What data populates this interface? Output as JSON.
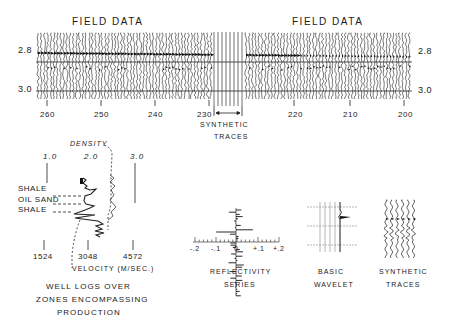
{
  "seismic_section": {
    "left_title": "FIELD DATA",
    "right_title": "FIELD DATA",
    "time_labels_left": [
      "2.8",
      "3.0"
    ],
    "time_labels_right": [
      "2.8",
      "3.0"
    ],
    "trace_numbers": [
      "260",
      "250",
      "240",
      "230",
      "220",
      "210",
      "200"
    ],
    "synthetic_traces_label_line1": "SYNTHETIC",
    "synthetic_traces_label_line2": "TRACES"
  },
  "well_logs": {
    "density_label": "DENSITY",
    "density_ticks": [
      "1.0",
      "2.0",
      "3.0"
    ],
    "zone_labels": [
      "SHALE",
      "OIL SAND",
      "SHALE"
    ],
    "velocity_ticks": [
      "1524",
      "3048",
      "4572"
    ],
    "velocity_label": "VELOCITY (M/SEC.)",
    "caption_line1": "WELL LOGS OVER",
    "caption_line2": "ZONES   ENCOMPASSING",
    "caption_line3": "PRODUCTION"
  },
  "reflectivity": {
    "ticks": [
      "-.2",
      "-.1",
      "0",
      "+.1",
      "+.2"
    ],
    "caption_line1": "REFLECTIVITY",
    "caption_line2": "SERIES"
  },
  "wavelet": {
    "caption_line1": "BASIC",
    "caption_line2": "WAVELET"
  },
  "synthetic": {
    "caption_line1": "SYNTHETIC",
    "caption_line2": "TRACES"
  }
}
